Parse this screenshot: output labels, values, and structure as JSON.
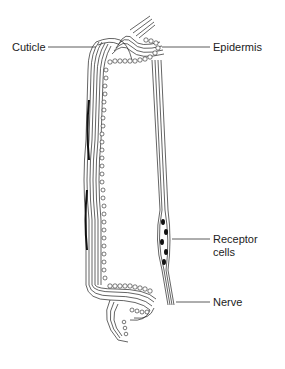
{
  "diagram": {
    "type": "anatomical cross-section",
    "labels": {
      "cuticle": "Cuticle",
      "epidermis": "Epidermis",
      "receptor_line1": "Receptor",
      "receptor_line2": "cells",
      "nerve": "Nerve"
    }
  }
}
